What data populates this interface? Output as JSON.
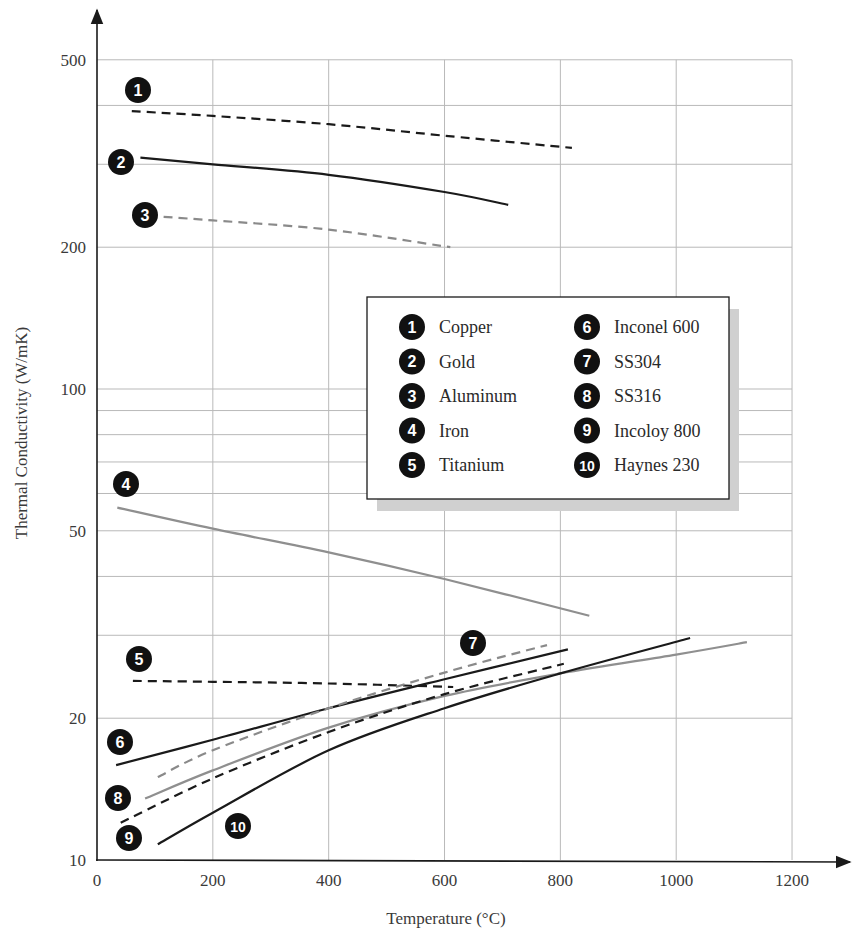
{
  "chart_data": {
    "type": "line",
    "title": "",
    "xlabel": "Temperature (°C)",
    "ylabel": "Thermal Conductivity (W/mK)",
    "x_scale": "linear",
    "y_scale": "log",
    "xlim": [
      0,
      1200
    ],
    "ylim": [
      10,
      500
    ],
    "x_ticks": [
      0,
      200,
      400,
      600,
      800,
      1000,
      1200
    ],
    "y_ticks": [
      10,
      20,
      50,
      100,
      200,
      500
    ],
    "y_tick_labels": [
      "10",
      "20",
      "50",
      "100",
      "200",
      "500"
    ],
    "y_gridlines": [
      10,
      20,
      30,
      40,
      50,
      60,
      70,
      80,
      90,
      100,
      200,
      300,
      400,
      500
    ],
    "grid": true,
    "legend_position": "center-right (inside plot)",
    "series": [
      {
        "id": 1,
        "name": "Copper",
        "color": "#1a1a1a",
        "style": "dashed",
        "x": [
          60,
          200,
          400,
          600,
          820
        ],
        "y": [
          389,
          380,
          365,
          345,
          325
        ],
        "badge": {
          "x": 138,
          "y": 90
        }
      },
      {
        "id": 2,
        "name": "Gold",
        "color": "#1a1a1a",
        "style": "solid",
        "x": [
          75,
          200,
          400,
          600,
          710
        ],
        "y": [
          310,
          300,
          285,
          262,
          246
        ],
        "badge": {
          "x": 121,
          "y": 162
        }
      },
      {
        "id": 3,
        "name": "Aluminum",
        "color": "#8a8a8a",
        "style": "dashed",
        "x": [
          115,
          200,
          400,
          610
        ],
        "y": [
          232,
          228,
          218,
          200
        ],
        "badge": {
          "x": 145,
          "y": 215
        }
      },
      {
        "id": 4,
        "name": "Iron",
        "color": "#8f8f8f",
        "style": "solid",
        "x": [
          35,
          200,
          400,
          600,
          850
        ],
        "y": [
          56,
          50.5,
          45,
          39.5,
          33
        ],
        "badge": {
          "x": 126,
          "y": 484
        }
      },
      {
        "id": 5,
        "name": "Titanium",
        "color": "#1a1a1a",
        "style": "dashed",
        "x": [
          62,
          200,
          400,
          615
        ],
        "y": [
          24.0,
          23.9,
          23.7,
          23.3
        ],
        "badge": {
          "x": 139,
          "y": 659
        }
      },
      {
        "id": 6,
        "name": "Inconel 600",
        "color": "#1a1a1a",
        "style": "solid",
        "x": [
          33,
          200,
          400,
          600,
          813
        ],
        "y": [
          15.9,
          18.0,
          21.0,
          24.2,
          28.0
        ],
        "badge": {
          "x": 120,
          "y": 742
        }
      },
      {
        "id": 7,
        "name": "SS304",
        "color": "#8a8a8a",
        "style": "dashed",
        "x": [
          105,
          200,
          400,
          600,
          777
        ],
        "y": [
          15.0,
          17.1,
          21.0,
          25.0,
          28.6
        ],
        "badge": {
          "x": 473,
          "y": 643
        }
      },
      {
        "id": 8,
        "name": "SS316",
        "color": "#8f8f8f",
        "style": "solid",
        "x": [
          83,
          200,
          400,
          600,
          800,
          1000,
          1122
        ],
        "y": [
          13.5,
          15.5,
          19.1,
          22.3,
          24.9,
          27.3,
          29.0
        ],
        "badge": {
          "x": 118,
          "y": 798
        }
      },
      {
        "id": 9,
        "name": "Incoloy 800",
        "color": "#1a1a1a",
        "style": "dashed",
        "x": [
          41,
          200,
          400,
          600,
          806
        ],
        "y": [
          12.0,
          14.9,
          18.7,
          22.5,
          26.1
        ],
        "badge": {
          "x": 129,
          "y": 838
        }
      },
      {
        "id": 10,
        "name": "Haynes 230",
        "color": "#1a1a1a",
        "style": "solid",
        "x": [
          105,
          200,
          400,
          600,
          800,
          1024
        ],
        "y": [
          10.8,
          12.6,
          17.1,
          21.0,
          24.9,
          29.6
        ],
        "badge": {
          "x": 238,
          "y": 826
        }
      }
    ]
  },
  "legend": {
    "columns": [
      [
        {
          "num": "1",
          "label": "Copper"
        },
        {
          "num": "2",
          "label": "Gold"
        },
        {
          "num": "3",
          "label": "Aluminum"
        },
        {
          "num": "4",
          "label": "Iron"
        },
        {
          "num": "5",
          "label": "Titanium"
        }
      ],
      [
        {
          "num": "6",
          "label": "Inconel 600"
        },
        {
          "num": "7",
          "label": "SS304"
        },
        {
          "num": "8",
          "label": "SS316"
        },
        {
          "num": "9",
          "label": "Incoloy 800"
        },
        {
          "num": "10",
          "label": "Haynes 230"
        }
      ]
    ]
  },
  "axes": {
    "x_title": "Temperature (°C)",
    "y_title": "Thermal Conductivity (W/mK)",
    "x_tick_labels": [
      "0",
      "200",
      "400",
      "600",
      "800",
      "1000",
      "1200"
    ],
    "y_tick_labels": [
      "10",
      "20",
      "50",
      "100",
      "200",
      "500"
    ]
  },
  "colors": {
    "dark_line": "#1a1a1a",
    "gray_line": "#8f8f8f",
    "grid": "#b9b9b9",
    "badge": "#111111",
    "legend_shadow": "#d0d0d0"
  }
}
